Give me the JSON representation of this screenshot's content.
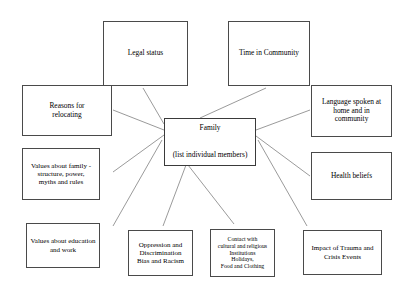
{
  "diagram": {
    "background_color": "#ffffff",
    "line_color": "#808080",
    "border_color": "#4a4a4a",
    "center": {
      "title": "Family",
      "subtitle": "(list individual members)"
    },
    "nodes": [
      {
        "id": "legal-status",
        "label": "Legal status"
      },
      {
        "id": "time-in-community",
        "label": "Time in Community"
      },
      {
        "id": "reasons-relocating",
        "label": "Reasons for\nrelocating"
      },
      {
        "id": "language-spoken",
        "label": "Language spoken at\nhome and in\ncommunity"
      },
      {
        "id": "values-family",
        "label": "Values about family -\nstructure, power,\nmyths and rules"
      },
      {
        "id": "health-beliefs",
        "label": "Health beliefs"
      },
      {
        "id": "values-education",
        "label": "Values about education\nand work"
      },
      {
        "id": "oppression",
        "label": "Oppression and\nDiscrimination\nBias and Racism"
      },
      {
        "id": "cultural-contact",
        "label": "Contact with\ncultural and religious\nInstitutions\nHolidays,\nFood and Clothing"
      },
      {
        "id": "trauma-impact",
        "label": "Impact of  Trauma and\nCrisis Events"
      }
    ]
  }
}
